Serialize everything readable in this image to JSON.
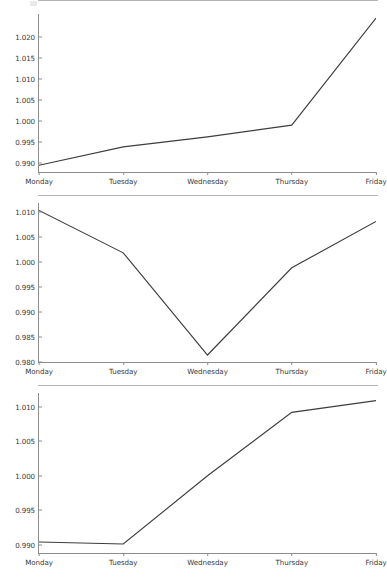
{
  "figure": {
    "background": "#ffffff",
    "line_color": "#3d3d3d",
    "axis_color": "#8d8d8d",
    "panel_count": 3
  },
  "chart_data": [
    {
      "type": "line",
      "title": "",
      "xlabel": "",
      "ylabel": "",
      "categories": [
        "Monday",
        "Tuesday",
        "Wednesday",
        "Thursday",
        "Friday"
      ],
      "values": [
        0.9894,
        0.9938,
        0.9962,
        0.999,
        1.0246
      ],
      "ytick_labels": [
        "1.020",
        "1.015",
        "1.010",
        "1.005",
        "1.000",
        "0.995",
        "0.990"
      ],
      "ytick_values": [
        1.02,
        1.015,
        1.01,
        1.005,
        1.0,
        0.995,
        0.99
      ],
      "ylim": [
        0.9878,
        1.0256
      ],
      "grid": false,
      "legend": null
    },
    {
      "type": "line",
      "title": "",
      "xlabel": "",
      "ylabel": "",
      "categories": [
        "Monday",
        "Tuesday",
        "Wednesday",
        "Thursday",
        "Friday"
      ],
      "values": [
        1.0103,
        1.0018,
        0.9813,
        0.9988,
        1.0081
      ],
      "ytick_labels": [
        "1.010",
        "1.005",
        "1.000",
        "0.995",
        "0.990",
        "0.985",
        "0.980"
      ],
      "ytick_values": [
        1.01,
        1.005,
        1.0,
        0.995,
        0.99,
        0.985,
        0.98
      ],
      "ylim": [
        0.9799,
        1.0118
      ],
      "grid": false,
      "legend": null
    },
    {
      "type": "line",
      "title": "",
      "xlabel": "",
      "ylabel": "",
      "categories": [
        "Monday",
        "Tuesday",
        "Wednesday",
        "Thursday",
        "Friday"
      ],
      "values": [
        0.9904,
        0.9901,
        1.0,
        1.0092,
        1.0109
      ],
      "ytick_labels": [
        "1.010",
        "1.005",
        "1.000",
        "0.995",
        "0.990"
      ],
      "ytick_values": [
        1.01,
        1.005,
        1.0,
        0.995,
        0.99
      ],
      "ylim": [
        0.9888,
        1.012
      ],
      "grid": false,
      "legend": null
    }
  ]
}
